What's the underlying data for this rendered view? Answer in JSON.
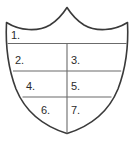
{
  "figure": {
    "name": "shield-seven-regions",
    "background_color": "#ffffff",
    "outline_color": "#3a3a3a",
    "divider_color": "#6b6b6b",
    "label_color": "#2b2b2b"
  },
  "regions": [
    {
      "id": "region-1",
      "label": "1.",
      "x": 11,
      "y": 30
    },
    {
      "id": "region-2",
      "label": "2.",
      "x": 15,
      "y": 55
    },
    {
      "id": "region-3",
      "label": "3.",
      "x": 71,
      "y": 55
    },
    {
      "id": "region-4",
      "label": "4.",
      "x": 26,
      "y": 81
    },
    {
      "id": "region-5",
      "label": "5.",
      "x": 71,
      "y": 81
    },
    {
      "id": "region-6",
      "label": "6.",
      "x": 41,
      "y": 105
    },
    {
      "id": "region-7",
      "label": "7.",
      "x": 71,
      "y": 105
    }
  ],
  "geometry": {
    "outline_path": "M 6.5 22.5 C 20 31 38 32 50 25 C 58 20 63.5 13 67 7.5 C 70.5 13 76 20 84 25 C 96 32 114 31 127.5 22.5 C 128.6 45 126 68 118 89 C 109 111 91 126 67 133.5 C 43 126 25 111 16 89 C 8 68 5.4 45 6.5 22.5 Z",
    "divider_lines": [
      {
        "name": "horizontal-divider-1",
        "x1": 7.6,
        "y1": 43.5,
        "x2": 126.6,
        "y2": 43.5
      },
      {
        "name": "horizontal-divider-2",
        "x1": 13.0,
        "y1": 71.0,
        "x2": 121.2,
        "y2": 71.0
      },
      {
        "name": "horizontal-divider-3",
        "x1": 22.5,
        "y1": 97.0,
        "x2": 111.5,
        "y2": 97.0
      },
      {
        "name": "vertical-divider",
        "x1": 67.0,
        "y1": 43.5,
        "x2": 67.0,
        "y2": 133.5
      }
    ]
  }
}
